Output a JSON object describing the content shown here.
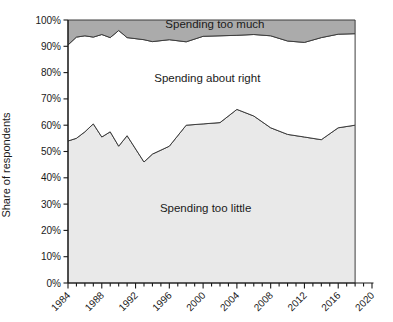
{
  "chart_data": {
    "type": "area",
    "stacked": true,
    "title": "",
    "xlabel": "",
    "ylabel": "Share of respondents",
    "xlim": [
      1984,
      2020
    ],
    "ylim": [
      0,
      100
    ],
    "data_end_year": 2018,
    "x": [
      1984,
      1985,
      1986,
      1987,
      1988,
      1989,
      1990,
      1991,
      1993,
      1994,
      1996,
      1998,
      2000,
      2002,
      2004,
      2006,
      2008,
      2010,
      2012,
      2014,
      2016,
      2018
    ],
    "series": [
      {
        "name": "Spending too little",
        "color": "#e9e9e9",
        "values": [
          54,
          55,
          57.5,
          60.5,
          55.5,
          57.5,
          52,
          56,
          46,
          49,
          52,
          60,
          60.5,
          61,
          66,
          63.5,
          59,
          56.5,
          55.5,
          54.5,
          59,
          60
        ]
      },
      {
        "name": "Spending about right",
        "color": "#ffffff",
        "values": [
          36.5,
          38.5,
          36.5,
          33,
          39,
          35.8,
          44,
          37.3,
          46.5,
          42.8,
          40.5,
          31.7,
          33.3,
          33,
          28.2,
          31,
          35,
          35.5,
          36,
          38.8,
          35.6,
          34.8
        ]
      },
      {
        "name": "Spending too much",
        "color": "#ababab",
        "values": [
          9.5,
          6.5,
          6,
          6.5,
          5.5,
          6.7,
          4,
          6.7,
          7.5,
          8.2,
          7.5,
          8.3,
          6.2,
          6,
          5.8,
          5.5,
          6,
          8,
          8.5,
          6.7,
          5.4,
          5.2
        ]
      }
    ],
    "annotations": [
      {
        "text": "Spending too much",
        "year": 2001.4,
        "value": 98.2
      },
      {
        "text": "Spending about right",
        "year": 2000.5,
        "value": 77.5
      },
      {
        "text": "Spending too little",
        "year": 2000.3,
        "value": 28.0
      }
    ],
    "y_ticks": [
      {
        "value": 0,
        "label": "0%"
      },
      {
        "value": 10,
        "label": "10%"
      },
      {
        "value": 20,
        "label": "20%"
      },
      {
        "value": 30,
        "label": "30%"
      },
      {
        "value": 40,
        "label": "40%"
      },
      {
        "value": 50,
        "label": "50%"
      },
      {
        "value": 60,
        "label": "60%"
      },
      {
        "value": 70,
        "label": "70%"
      },
      {
        "value": 80,
        "label": "80%"
      },
      {
        "value": 90,
        "label": "90%"
      },
      {
        "value": 100,
        "label": "100%"
      }
    ],
    "x_tick_major_labels": [
      "1984",
      "1988",
      "1992",
      "1996",
      "2000",
      "2004",
      "2008",
      "2012",
      "2016",
      "2020"
    ],
    "x_tick_minor_step": 1,
    "x_tick_major_step": 4,
    "grid": false,
    "legend_position": "inside-annotations",
    "outline_color": "#3d3d3d",
    "axis_color": "#1a1a1a"
  }
}
